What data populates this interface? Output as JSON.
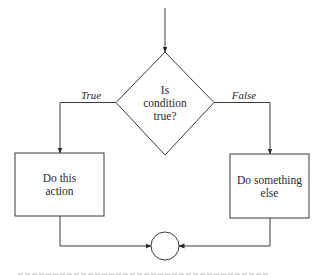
{
  "diagram": {
    "type": "flowchart",
    "nodes": {
      "decision": {
        "shape": "diamond",
        "lines": [
          "Is",
          "condition",
          "true?"
        ]
      },
      "true_action": {
        "shape": "rectangle",
        "lines": [
          "Do this",
          "action"
        ]
      },
      "false_action": {
        "shape": "rectangle",
        "lines": [
          "Do something",
          "else"
        ]
      },
      "merge": {
        "shape": "circle"
      }
    },
    "edges": {
      "true_label": "True",
      "false_label": "False"
    },
    "colors": {
      "stroke": "#3a3a3a",
      "text": "#2a2a2a",
      "background": "#ffffff"
    }
  }
}
